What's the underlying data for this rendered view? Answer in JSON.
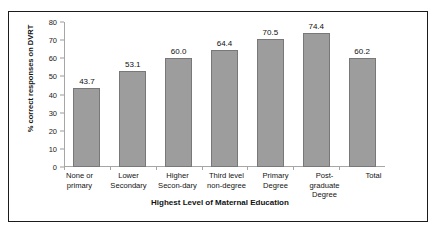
{
  "chart_data": {
    "type": "bar",
    "title": "",
    "xlabel": "Highest Level of Maternal Education",
    "ylabel": "% correct responses on DVRT",
    "categories": [
      "None or\nprimary",
      "Lower\nSecondary",
      "Higher\nSecon-dary",
      "Third level\nnon-degree",
      "Primary\nDegree",
      "Post-\ngraduate\nDegree",
      "Total"
    ],
    "values": [
      43.7,
      53.1,
      60.0,
      64.4,
      70.5,
      74.4,
      60.2
    ],
    "value_labels": [
      "43.7",
      "53.1",
      "60.0",
      "64.4",
      "70.5",
      "74.4",
      "60.2"
    ],
    "ylim": [
      0,
      80
    ],
    "ytick_labels": [
      "80",
      "70",
      "60",
      "50",
      "40",
      "30",
      "20",
      "10",
      "0"
    ],
    "ytick_values": [
      80,
      70,
      60,
      50,
      40,
      30,
      20,
      10,
      0
    ],
    "grid": false,
    "legend": false,
    "bar_color": "#9d9d9d",
    "bar_border_color": "#787878",
    "axis_color": "#a6a6a6",
    "frame_color": "#1b1b1b",
    "background": "#ffffff"
  }
}
